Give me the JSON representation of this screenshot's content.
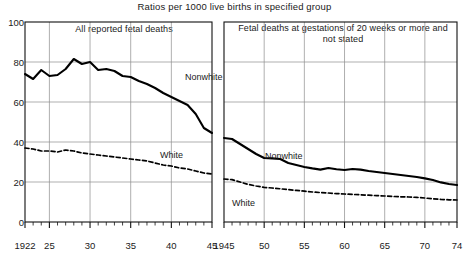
{
  "chart_data": {
    "type": "line",
    "title": "Ratios per 1000 live births in specified group",
    "xlabel": "",
    "ylabel": "",
    "ylim": [
      0,
      100
    ],
    "yticks": [
      0,
      20,
      40,
      60,
      80,
      100
    ],
    "grid": true,
    "legend_position": "inline-annotations",
    "panels": [
      {
        "id": "left",
        "title": "All reported fetal deaths",
        "xlim": [
          1922,
          1945
        ],
        "xticks": [
          1922,
          1925,
          1930,
          1935,
          1940,
          1945
        ],
        "xticklabels": [
          "1922",
          "25",
          "30",
          "35",
          "40",
          "45"
        ],
        "minor_tick_step": 1,
        "series": [
          {
            "name": "Nonwhite",
            "style": "solid",
            "color": "#000000",
            "x": [
              1922,
              1923,
              1924,
              1925,
              1926,
              1927,
              1928,
              1929,
              1930,
              1931,
              1932,
              1933,
              1934,
              1935,
              1936,
              1937,
              1938,
              1939,
              1940,
              1941,
              1942,
              1943,
              1944,
              1945
            ],
            "values": [
              74,
              71.5,
              76,
              73,
              73.5,
              76.5,
              81.5,
              79,
              80,
              76,
              76.5,
              75.5,
              73,
              72.5,
              70.5,
              69,
              67,
              64.5,
              62.5,
              60.5,
              58.5,
              54,
              47,
              44.5
            ]
          },
          {
            "name": "White",
            "style": "dashed",
            "color": "#000000",
            "x": [
              1922,
              1923,
              1924,
              1925,
              1926,
              1927,
              1928,
              1929,
              1930,
              1931,
              1932,
              1933,
              1934,
              1935,
              1936,
              1937,
              1938,
              1939,
              1940,
              1941,
              1942,
              1943,
              1944,
              1945
            ],
            "values": [
              37,
              36.5,
              35.5,
              35.5,
              35,
              36,
              35.5,
              34.5,
              34,
              33.5,
              33,
              32.5,
              32,
              31.5,
              31,
              30.5,
              29.5,
              28.5,
              28,
              27,
              26.5,
              25.5,
              24.5,
              24
            ]
          }
        ]
      },
      {
        "id": "right",
        "title": "Fetal deaths at gestations of 20 weeks or more and not stated",
        "xlim": [
          1945,
          1974
        ],
        "xticks": [
          1945,
          1950,
          1955,
          1960,
          1965,
          1970,
          1974
        ],
        "xticklabels": [
          "1945",
          "50",
          "55",
          "60",
          "65",
          "70",
          "74"
        ],
        "minor_tick_step": 1,
        "series": [
          {
            "name": "Nonwhite",
            "style": "solid",
            "color": "#000000",
            "x": [
              1945,
              1946,
              1947,
              1948,
              1949,
              1950,
              1951,
              1952,
              1953,
              1954,
              1955,
              1956,
              1957,
              1958,
              1959,
              1960,
              1961,
              1962,
              1963,
              1964,
              1965,
              1966,
              1967,
              1968,
              1969,
              1970,
              1971,
              1972,
              1973,
              1974
            ],
            "values": [
              42,
              41.5,
              39,
              36.5,
              34,
              32,
              31.8,
              31.5,
              29.5,
              28.5,
              27.5,
              26.8,
              26.2,
              27,
              26.4,
              26,
              26.5,
              26.2,
              25.5,
              25,
              24.5,
              24,
              23.5,
              23,
              22.5,
              21.8,
              21,
              19.8,
              19,
              18.5
            ]
          },
          {
            "name": "White",
            "style": "dashed",
            "color": "#000000",
            "x": [
              1945,
              1946,
              1947,
              1948,
              1949,
              1950,
              1951,
              1952,
              1953,
              1954,
              1955,
              1956,
              1957,
              1958,
              1959,
              1960,
              1961,
              1962,
              1963,
              1964,
              1965,
              1966,
              1967,
              1968,
              1969,
              1970,
              1971,
              1972,
              1973,
              1974
            ],
            "values": [
              21.5,
              21.2,
              20,
              18.8,
              18,
              17.3,
              17,
              16.6,
              16.2,
              15.8,
              15.4,
              15,
              14.7,
              14.5,
              14.2,
              14,
              13.8,
              13.6,
              13.4,
              13.2,
              13,
              12.8,
              12.6,
              12.5,
              12.3,
              12,
              11.6,
              11.3,
              11.1,
              11
            ]
          }
        ]
      }
    ],
    "annotations": [
      {
        "panel": "left",
        "text": "Nonwhite",
        "x": 185,
        "y": 72
      },
      {
        "panel": "left",
        "text": "White",
        "x": 160,
        "y": 150
      },
      {
        "panel": "right",
        "text": "Nonwhite",
        "x": 265,
        "y": 151
      },
      {
        "panel": "right",
        "text": "White",
        "x": 232,
        "y": 198
      }
    ]
  }
}
